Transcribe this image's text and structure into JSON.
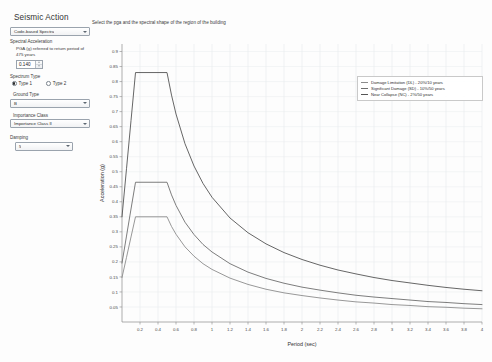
{
  "panel": {
    "title": "Seismic Action",
    "spectra_source": {
      "label": "",
      "value": "Code-based Spectra"
    },
    "spectral_acceleration_label": "Spectral Acceleration",
    "pga_helper": "PGA (g) referred to return period of 475 years",
    "pga_value": "0.140",
    "spectrum_type_label": "Spectrum Type",
    "type1_label": "Type 1",
    "type2_label": "Type 2",
    "type_selected": "Type 1",
    "ground_type_label": "Ground Type",
    "ground_type_value": "B",
    "importance_class_label": "Importance Class",
    "importance_class_value": "Importance Class II",
    "damping_label": "Damping",
    "damping_value": "5"
  },
  "instruction": "Select the pga and the spectral shape of the region of the building",
  "legend": {
    "items": [
      {
        "label": "Damage Limitation (DL) - 20%/10 years",
        "color": "#8c8c8c"
      },
      {
        "label": "Significant Damage (SD) - 10%/50 years",
        "color": "#6e6e6e"
      },
      {
        "label": "Near Collapse (NC) - 2%/50 years",
        "color": "#555555"
      }
    ]
  },
  "chart_data": {
    "type": "line",
    "title": "",
    "xlabel": "Period (sec)",
    "ylabel": "Acceleration (g)",
    "xlim": [
      0,
      4
    ],
    "ylim": [
      0,
      0.925
    ],
    "grid": true,
    "legend_position": "top-right",
    "xticks": [
      0.2,
      0.4,
      0.6,
      0.8,
      1,
      1.2,
      1.4,
      1.6,
      1.8,
      2,
      2.2,
      2.4,
      2.6,
      2.8,
      3,
      3.2,
      3.4,
      3.6,
      3.8,
      4
    ],
    "yticks": [
      0.05,
      0.1,
      0.15,
      0.2,
      0.25,
      0.3,
      0.35,
      0.4,
      0.45,
      0.5,
      0.55,
      0.6,
      0.65,
      0.7,
      0.75,
      0.8,
      0.85,
      0.9
    ],
    "series": [
      {
        "name": "Near Collapse (NC) - 2%/50 years",
        "color": "#555555",
        "points": [
          [
            0,
            0.35
          ],
          [
            0.05,
            0.51
          ],
          [
            0.1,
            0.67
          ],
          [
            0.15,
            0.83
          ],
          [
            0.2,
            0.83
          ],
          [
            0.3,
            0.83
          ],
          [
            0.4,
            0.83
          ],
          [
            0.5,
            0.83
          ],
          [
            0.55,
            0.755
          ],
          [
            0.6,
            0.692
          ],
          [
            0.7,
            0.593
          ],
          [
            0.8,
            0.519
          ],
          [
            0.9,
            0.461
          ],
          [
            1.0,
            0.415
          ],
          [
            1.2,
            0.346
          ],
          [
            1.4,
            0.297
          ],
          [
            1.6,
            0.26
          ],
          [
            1.8,
            0.231
          ],
          [
            2.0,
            0.208
          ],
          [
            2.2,
            0.189
          ],
          [
            2.4,
            0.173
          ],
          [
            2.6,
            0.16
          ],
          [
            2.8,
            0.148
          ],
          [
            3.0,
            0.138
          ],
          [
            3.2,
            0.13
          ],
          [
            3.4,
            0.122
          ],
          [
            3.6,
            0.115
          ],
          [
            3.8,
            0.109
          ],
          [
            4.0,
            0.104
          ]
        ]
      },
      {
        "name": "Significant Damage (SD) - 10%/50 years",
        "color": "#6e6e6e",
        "points": [
          [
            0,
            0.196
          ],
          [
            0.05,
            0.286
          ],
          [
            0.1,
            0.376
          ],
          [
            0.15,
            0.465
          ],
          [
            0.2,
            0.465
          ],
          [
            0.3,
            0.465
          ],
          [
            0.4,
            0.465
          ],
          [
            0.5,
            0.465
          ],
          [
            0.55,
            0.423
          ],
          [
            0.6,
            0.388
          ],
          [
            0.7,
            0.332
          ],
          [
            0.8,
            0.291
          ],
          [
            0.9,
            0.258
          ],
          [
            1.0,
            0.233
          ],
          [
            1.2,
            0.194
          ],
          [
            1.4,
            0.166
          ],
          [
            1.6,
            0.145
          ],
          [
            1.8,
            0.129
          ],
          [
            2.0,
            0.116
          ],
          [
            2.2,
            0.106
          ],
          [
            2.4,
            0.097
          ],
          [
            2.6,
            0.089
          ],
          [
            2.8,
            0.083
          ],
          [
            3.0,
            0.078
          ],
          [
            3.2,
            0.073
          ],
          [
            3.4,
            0.068
          ],
          [
            3.6,
            0.065
          ],
          [
            3.8,
            0.061
          ],
          [
            4.0,
            0.058
          ]
        ]
      },
      {
        "name": "Damage Limitation (DL) - 20%/10 years",
        "color": "#8c8c8c",
        "points": [
          [
            0,
            0.148
          ],
          [
            0.05,
            0.215
          ],
          [
            0.1,
            0.283
          ],
          [
            0.15,
            0.35
          ],
          [
            0.2,
            0.35
          ],
          [
            0.3,
            0.35
          ],
          [
            0.4,
            0.35
          ],
          [
            0.5,
            0.35
          ],
          [
            0.55,
            0.318
          ],
          [
            0.6,
            0.292
          ],
          [
            0.7,
            0.25
          ],
          [
            0.8,
            0.219
          ],
          [
            0.9,
            0.194
          ],
          [
            1.0,
            0.175
          ],
          [
            1.2,
            0.146
          ],
          [
            1.4,
            0.125
          ],
          [
            1.6,
            0.109
          ],
          [
            1.8,
            0.097
          ],
          [
            2.0,
            0.088
          ],
          [
            2.2,
            0.08
          ],
          [
            2.4,
            0.073
          ],
          [
            2.6,
            0.067
          ],
          [
            2.8,
            0.063
          ],
          [
            3.0,
            0.058
          ],
          [
            3.2,
            0.055
          ],
          [
            3.4,
            0.051
          ],
          [
            3.6,
            0.049
          ],
          [
            3.8,
            0.046
          ],
          [
            4.0,
            0.044
          ]
        ]
      }
    ]
  }
}
